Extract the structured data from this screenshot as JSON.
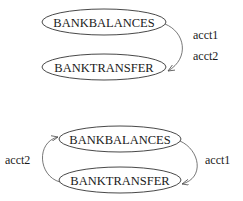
{
  "diagrams": [
    {
      "nodes": [
        {
          "id": "top_balances",
          "label": "BANKBALANCES"
        },
        {
          "id": "top_transfer",
          "label": "BANKTRANSFER"
        }
      ],
      "edges": [
        {
          "from": "top_balances",
          "to": "top_transfer",
          "labels": [
            "acct1",
            "acct2"
          ]
        }
      ]
    },
    {
      "nodes": [
        {
          "id": "bot_balances",
          "label": "BANKBALANCES"
        },
        {
          "id": "bot_transfer",
          "label": "BANKTRANSFER"
        }
      ],
      "edges": [
        {
          "from": "bot_balances",
          "to": "bot_transfer",
          "label": "acct1"
        },
        {
          "from": "bot_transfer",
          "to": "bot_balances",
          "label": "acct2"
        }
      ]
    }
  ],
  "colors": {
    "stroke": "#333333",
    "text": "#1a1a1a",
    "background": "#ffffff"
  }
}
